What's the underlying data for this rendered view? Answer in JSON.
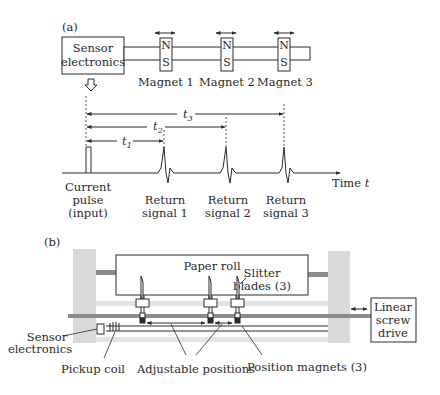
{
  "panel_a": {
    "label": "(a)",
    "sensor_box": {
      "line1": "Sensor",
      "line2": "electronics"
    },
    "magnets": [
      {
        "label": "Magnet 1",
        "north": "N",
        "south": "S"
      },
      {
        "label": "Magnet 2",
        "north": "N",
        "south": "S"
      },
      {
        "label": "Magnet 3",
        "north": "N",
        "south": "S"
      }
    ],
    "timing": {
      "intervals": [
        {
          "name": "t",
          "sub": "1"
        },
        {
          "name": "t",
          "sub": "2"
        },
        {
          "name": "t",
          "sub": "3"
        }
      ],
      "axis_label": "Time",
      "axis_var": "t",
      "pulse": {
        "line1": "Current",
        "line2": "pulse",
        "line3": "(input)"
      },
      "returns": [
        {
          "line1": "Return",
          "line2": "signal 1"
        },
        {
          "line1": "Return",
          "line2": "signal 2"
        },
        {
          "line1": "Return",
          "line2": "signal 3"
        }
      ]
    }
  },
  "panel_b": {
    "label": "(b)",
    "paper_roll": "Paper roll",
    "slitter": {
      "line1": "Slitter",
      "line2": "blades (3)"
    },
    "linear_drive": {
      "line1": "Linear",
      "line2": "screw",
      "line3": "drive"
    },
    "sensor": {
      "line1": "Sensor",
      "line2": "electronics"
    },
    "pickup_coil": "Pickup coil",
    "adjustable": "Adjustable positions",
    "position_magnets": "Position magnets (3)"
  },
  "colors": {
    "line": "#2a2a2a",
    "frame_gray": "#d9d9d9",
    "rod_gray": "#8c8c8c",
    "light_rod": "#e0e0e0"
  }
}
